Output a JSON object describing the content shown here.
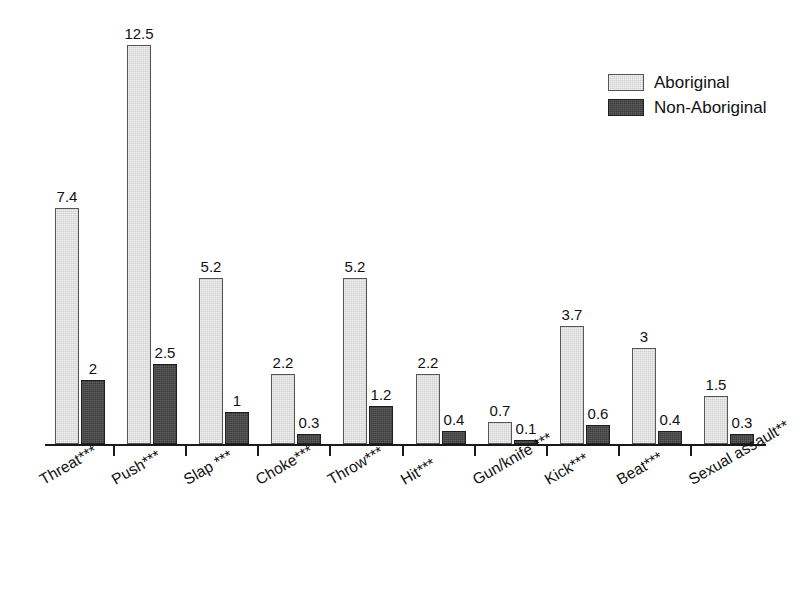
{
  "chart_data": {
    "type": "bar",
    "title": "",
    "subtitle": "",
    "xlabel": "",
    "ylabel": "",
    "ylim": [
      0,
      12.5
    ],
    "grid": false,
    "legend_position": "top-right",
    "categories": [
      "Threat***",
      "Push***",
      "Slap ***",
      "Choke***",
      "Throw***",
      "Hit***",
      "Gun/knife ***",
      "Kick***",
      "Beat***",
      "Sexual assault**"
    ],
    "series": [
      {
        "name": "Aboriginal",
        "color": "#cfcfcf",
        "values": [
          7.4,
          12.5,
          5.2,
          2.2,
          5.2,
          2.2,
          0.7,
          3.7,
          3,
          1.5
        ],
        "value_labels": [
          "7.4",
          "12.5",
          "5.2",
          "2.2",
          "5.2",
          "2.2",
          "0.7",
          "3.7",
          "3",
          "1.5"
        ]
      },
      {
        "name": "Non-Aboriginal",
        "color": "#3b3b3b",
        "values": [
          2,
          2.5,
          1,
          0.3,
          1.2,
          0.4,
          0.1,
          0.6,
          0.4,
          0.3
        ],
        "value_labels": [
          "2",
          "2.5",
          "1",
          "0.3",
          "1.2",
          "0.4",
          "0.1",
          "0.6",
          "0.4",
          "0.3"
        ]
      }
    ]
  },
  "legend": {
    "items": [
      {
        "label": "Aboriginal",
        "swatch": "light"
      },
      {
        "label": "Non-Aboriginal",
        "swatch": "dark"
      }
    ]
  }
}
